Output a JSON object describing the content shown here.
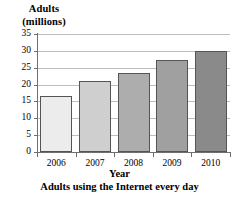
{
  "chart_data": {
    "type": "bar",
    "title": "",
    "caption": "Adults using the Internet every day",
    "xlabel": "Year",
    "ylabel": "Adults (millions)",
    "ylabel_lines": [
      "Adults",
      "(millions)"
    ],
    "categories": [
      "2006",
      "2007",
      "2008",
      "2009",
      "2010"
    ],
    "values": [
      16.5,
      21.1,
      23.3,
      27.3,
      30.1
    ],
    "ylim": [
      0,
      35
    ],
    "ytick_values": [
      0,
      5,
      10,
      15,
      20,
      25,
      30,
      35
    ],
    "ytick_labels": [
      "0",
      "5",
      "10",
      "15",
      "20",
      "25",
      "30",
      "35"
    ],
    "grid": true,
    "grid_axis": "y",
    "legend": false,
    "legend_position": "none",
    "bar_colors": [
      "#ececec",
      "#cfcfcf",
      "#adadad",
      "#a0a0a0",
      "#8a8a8a"
    ],
    "bar_border_color": "#555555",
    "axis_color": "#6f6f6f",
    "grid_color": "#bdbdbd",
    "background_color": "#ffffff",
    "series": [
      {
        "name": "Adults using the Internet every day",
        "values": [
          16.5,
          21.1,
          23.3,
          27.3,
          30.1
        ]
      }
    ],
    "points": [
      {
        "category": "2006",
        "value": 16.5
      },
      {
        "category": "2007",
        "value": 21.1
      },
      {
        "category": "2008",
        "value": 23.3
      },
      {
        "category": "2009",
        "value": 27.3
      },
      {
        "category": "2010",
        "value": 30.1
      }
    ]
  }
}
